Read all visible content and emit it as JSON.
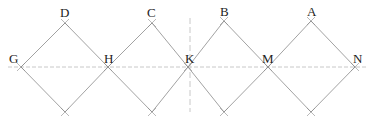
{
  "diagram": {
    "type": "geometry",
    "colors": {
      "edge": "#8a8a8a",
      "axis": "#c8c8c8",
      "label": "#222222"
    },
    "axis": {
      "horizontal": {
        "x1": 8,
        "y1": 67,
        "x2": 368,
        "y2": 67
      },
      "vertical": {
        "x1": 190,
        "y1": 18,
        "x2": 190,
        "y2": 112
      }
    },
    "points": [
      {
        "name": "G",
        "x": 21,
        "y": 67,
        "lx": 9,
        "ly": 63
      },
      {
        "name": "D",
        "x": 65,
        "y": 23,
        "lx": 60,
        "ly": 17
      },
      {
        "name": "H",
        "x": 108,
        "y": 67,
        "lx": 104,
        "ly": 63
      },
      {
        "name": "C",
        "x": 152,
        "y": 23,
        "lx": 147,
        "ly": 17
      },
      {
        "name": "K",
        "x": 188,
        "y": 67,
        "lx": 185,
        "ly": 63
      },
      {
        "name": "B",
        "x": 224,
        "y": 21,
        "lx": 220,
        "ly": 16
      },
      {
        "name": "M",
        "x": 268,
        "y": 67,
        "lx": 262,
        "ly": 63
      },
      {
        "name": "A",
        "x": 311,
        "y": 21,
        "lx": 307,
        "ly": 16
      },
      {
        "name": "N",
        "x": 355,
        "y": 67,
        "lx": 353,
        "ly": 63
      }
    ],
    "bottoms": [
      {
        "x": 65,
        "y": 112
      },
      {
        "x": 152,
        "y": 112
      },
      {
        "x": 224,
        "y": 112
      },
      {
        "x": 311,
        "y": 112
      }
    ],
    "squares": [
      [
        "G",
        "D",
        "H",
        "B0"
      ],
      [
        "H",
        "C",
        "K",
        "B1"
      ],
      [
        "K",
        "B",
        "M",
        "B2"
      ],
      [
        "M",
        "A",
        "N",
        "B3"
      ]
    ]
  }
}
